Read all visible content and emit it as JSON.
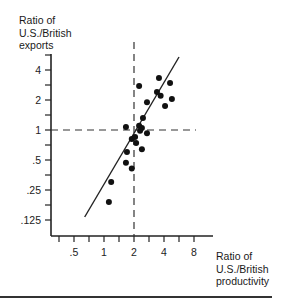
{
  "chart_data": {
    "type": "scatter",
    "title": "",
    "xlabel": "Ratio of U.S./British productivity",
    "ylabel": "Ratio of U.S./British exports",
    "xlabel_lines": [
      "Ratio of",
      "U.S./British",
      "productivity"
    ],
    "ylabel_lines": [
      "Ratio of",
      "U.S./British",
      "exports"
    ],
    "x_scale": "log2",
    "y_scale": "log2",
    "x_ticks": [
      ".5",
      "1",
      "2",
      "4",
      "8"
    ],
    "y_ticks": [
      "4",
      "2",
      "1",
      ".5",
      ".25",
      ".125"
    ],
    "xlim": [
      0.3,
      11
    ],
    "ylim": [
      0.1,
      6
    ],
    "grid": false,
    "reference_lines": {
      "x": 2,
      "y": 1,
      "style": "dashed"
    },
    "regression_line": {
      "from": [
        0.64,
        0.134
      ],
      "to": [
        5.66,
        5.4
      ]
    },
    "points": [
      {
        "x": 2.25,
        "y": 2.76
      },
      {
        "x": 3.56,
        "y": 3.33
      },
      {
        "x": 4.6,
        "y": 2.96
      },
      {
        "x": 3.4,
        "y": 2.4
      },
      {
        "x": 3.7,
        "y": 2.2
      },
      {
        "x": 4.8,
        "y": 2.05
      },
      {
        "x": 2.7,
        "y": 1.9
      },
      {
        "x": 4.1,
        "y": 1.74
      },
      {
        "x": 2.46,
        "y": 1.32
      },
      {
        "x": 1.66,
        "y": 1.07
      },
      {
        "x": 2.25,
        "y": 1.1
      },
      {
        "x": 2.4,
        "y": 1.05
      },
      {
        "x": 2.3,
        "y": 0.98
      },
      {
        "x": 2.7,
        "y": 0.93
      },
      {
        "x": 1.9,
        "y": 0.81
      },
      {
        "x": 2.05,
        "y": 0.85
      },
      {
        "x": 2.1,
        "y": 0.74
      },
      {
        "x": 2.4,
        "y": 0.64
      },
      {
        "x": 1.7,
        "y": 0.6
      },
      {
        "x": 1.66,
        "y": 0.47
      },
      {
        "x": 1.9,
        "y": 0.41
      },
      {
        "x": 1.18,
        "y": 0.3
      },
      {
        "x": 1.12,
        "y": 0.19
      }
    ]
  }
}
